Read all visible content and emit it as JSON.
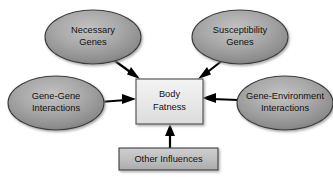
{
  "diagram": {
    "type": "concept-diagram",
    "background_color": "#ffffff",
    "center": {
      "id": "body-fatness",
      "shape": "rectangle",
      "line1": "Body",
      "line2": "Fatness",
      "fill_color": "#e8e8e8",
      "border_color": "#4a4a4a"
    },
    "ellipses": [
      {
        "id": "necessary-genes",
        "line1": "Necessary",
        "line2": "Genes",
        "fill_color": "#9a9a9a",
        "border_color": "#3c3c3c",
        "position": "top-left"
      },
      {
        "id": "susceptibility-genes",
        "line1": "Susceptibility",
        "line2": "Genes",
        "fill_color": "#9a9a9a",
        "border_color": "#3c3c3c",
        "position": "top-right"
      },
      {
        "id": "gene-gene-interactions",
        "line1": "Gene-Gene",
        "line2": "Interactions",
        "fill_color": "#9a9a9a",
        "border_color": "#3c3c3c",
        "position": "middle-left"
      },
      {
        "id": "gene-environment-interactions",
        "line1": "Gene-Environment",
        "line2": "Interactions",
        "fill_color": "#9a9a9a",
        "border_color": "#3c3c3c",
        "position": "middle-right"
      }
    ],
    "bottom_box": {
      "id": "other-influences",
      "shape": "rectangle",
      "line1": "Other Influences",
      "fill_color": "#b9b9b9",
      "border_color": "#3c3c3c",
      "position": "bottom-center"
    },
    "arrows": [
      {
        "id": "arrow-necessary-genes",
        "from": "necessary-genes",
        "to": "body-fatness",
        "direction": "down-right",
        "color": "#000000"
      },
      {
        "id": "arrow-susceptibility-genes",
        "from": "susceptibility-genes",
        "to": "body-fatness",
        "direction": "down-left",
        "color": "#000000"
      },
      {
        "id": "arrow-gene-gene",
        "from": "gene-gene-interactions",
        "to": "body-fatness",
        "direction": "right",
        "color": "#000000"
      },
      {
        "id": "arrow-gene-environment",
        "from": "gene-environment-interactions",
        "to": "body-fatness",
        "direction": "left",
        "color": "#000000"
      },
      {
        "id": "arrow-other-influences",
        "from": "other-influences",
        "to": "body-fatness",
        "direction": "up",
        "color": "#000000"
      }
    ]
  }
}
